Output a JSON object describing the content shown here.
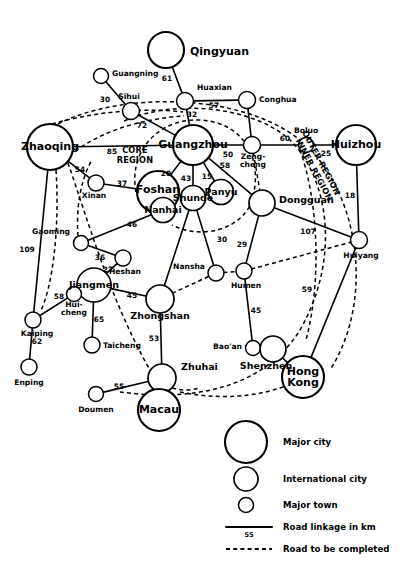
{
  "figure": {
    "type": "network-map",
    "width": 405,
    "height": 577,
    "background": "#ffffff",
    "stroke_color": "#000000"
  },
  "region_labels": [
    {
      "id": "core-region",
      "text_line1": "CORE",
      "text_line2": "REGION",
      "x": 135,
      "y": 150,
      "rotation": 0
    },
    {
      "id": "outer-region",
      "text": "OUTER REGION",
      "x": 321,
      "y": 163,
      "rotation": 62
    },
    {
      "id": "inner-region",
      "text": "INNER REGION",
      "x": 314,
      "y": 170,
      "rotation": 62
    }
  ],
  "nodes": [
    {
      "id": "qingyuan",
      "label": "Qingyuan",
      "x": 166,
      "y": 50,
      "r": 18,
      "tier": "major",
      "label_dx": 24,
      "label_dy": 2,
      "anchor": "start"
    },
    {
      "id": "guangning",
      "label": "Guangning",
      "x": 101,
      "y": 76,
      "r": 7.5,
      "tier": "town",
      "label_dx": 11,
      "label_dy": -2,
      "anchor": "start"
    },
    {
      "id": "sihui",
      "label": "Sihui",
      "x": 131,
      "y": 111,
      "r": 8.5,
      "tier": "town",
      "label_dx": -2,
      "label_dy": -14,
      "anchor": "middle"
    },
    {
      "id": "huaxian",
      "label": "Huaxian",
      "x": 185,
      "y": 101,
      "r": 8.5,
      "tier": "town",
      "label_dx": 12,
      "label_dy": -13,
      "anchor": "start"
    },
    {
      "id": "conghua",
      "label": "Conghua",
      "x": 247,
      "y": 100,
      "r": 8.5,
      "tier": "town",
      "label_dx": 12,
      "label_dy": 0,
      "anchor": "start"
    },
    {
      "id": "boluo",
      "label": "Boluo",
      "x": 306,
      "y": 145,
      "r": 7.5,
      "tier": "town",
      "label_dx": 0,
      "label_dy": -14,
      "anchor": "middle"
    },
    {
      "id": "huizhou",
      "label": "Huizhou",
      "x": 356,
      "y": 145,
      "r": 20,
      "tier": "major",
      "label_dx": 0,
      "label_dy": 0,
      "anchor": "middle"
    },
    {
      "id": "zhaoqing",
      "label": "Zhaoqing",
      "x": 50,
      "y": 147,
      "r": 23,
      "tier": "major",
      "label_dx": 0,
      "label_dy": 0,
      "anchor": "middle"
    },
    {
      "id": "guangzhou",
      "label": "Guangzhou",
      "x": 193,
      "y": 145,
      "r": 20,
      "tier": "major",
      "label_dx": 0,
      "label_dy": 0,
      "anchor": "middle"
    },
    {
      "id": "zengcheng",
      "label": "Zeng-\ncheng",
      "x": 252,
      "y": 145,
      "r": 8.5,
      "tier": "town",
      "label_dx": 1,
      "label_dy": 16,
      "anchor": "middle"
    },
    {
      "id": "xinan",
      "label": "Xinan",
      "x": 96,
      "y": 183,
      "r": 8,
      "tier": "town",
      "label_dx": -2,
      "label_dy": 13,
      "anchor": "middle"
    },
    {
      "id": "foshan",
      "label": "Foshan",
      "x": 158,
      "y": 192,
      "r": 21,
      "tier": "major",
      "label_dx": 0,
      "label_dy": -2,
      "anchor": "middle"
    },
    {
      "id": "nanhai",
      "label": "Nanhai",
      "x": 163,
      "y": 210,
      "r": 12.5,
      "tier": "intl",
      "label_dx": 0,
      "label_dy": 0,
      "anchor": "middle"
    },
    {
      "id": "shunde",
      "label": "Shunde",
      "x": 193,
      "y": 198,
      "r": 12.5,
      "tier": "intl",
      "label_dx": 0,
      "label_dy": 0,
      "anchor": "middle"
    },
    {
      "id": "panyu",
      "label": "Panyu",
      "x": 221,
      "y": 192,
      "r": 12.5,
      "tier": "intl",
      "label_dx": 0,
      "label_dy": 0,
      "anchor": "middle"
    },
    {
      "id": "dongguan",
      "label": "Dongguan",
      "x": 262,
      "y": 203,
      "r": 13,
      "tier": "intl",
      "label_dx": 17,
      "label_dy": -3,
      "anchor": "start"
    },
    {
      "id": "huiyang",
      "label": "Huiyang",
      "x": 359,
      "y": 240,
      "r": 8.5,
      "tier": "town",
      "label_dx": 2,
      "label_dy": 16,
      "anchor": "middle"
    },
    {
      "id": "gaoming",
      "label": "Gaoming",
      "x": 81,
      "y": 243,
      "r": 7.5,
      "tier": "town",
      "label_dx": -11,
      "label_dy": -11,
      "anchor": "end"
    },
    {
      "id": "heshan",
      "label": "Heshan",
      "x": 123,
      "y": 258,
      "r": 8,
      "tier": "town",
      "label_dx": 2,
      "label_dy": 14,
      "anchor": "middle"
    },
    {
      "id": "nansha",
      "label": "Nansha",
      "x": 216,
      "y": 273,
      "r": 8,
      "tier": "town",
      "label_dx": -11,
      "label_dy": -6,
      "anchor": "end"
    },
    {
      "id": "humen",
      "label": "Humen",
      "x": 244,
      "y": 271,
      "r": 8,
      "tier": "town",
      "label_dx": 2,
      "label_dy": 15,
      "anchor": "middle"
    },
    {
      "id": "jiangmen",
      "label": "Jiangmen",
      "x": 94,
      "y": 285,
      "r": 17,
      "tier": "intl",
      "label_dx": 0,
      "label_dy": 0,
      "anchor": "middle"
    },
    {
      "id": "huicheng",
      "label": "Hui-\ncheng",
      "x": 74,
      "y": 294,
      "r": 7.5,
      "tier": "town",
      "label_dx": 0,
      "label_dy": 15,
      "anchor": "middle"
    },
    {
      "id": "zhongshan",
      "label": "Zhongshan",
      "x": 160,
      "y": 299,
      "r": 14,
      "tier": "intl",
      "label_dx": 0,
      "label_dy": 17,
      "anchor": "middle"
    },
    {
      "id": "kaiping",
      "label": "Kaiping",
      "x": 33,
      "y": 320,
      "r": 8,
      "tier": "town",
      "label_dx": 4,
      "label_dy": 14,
      "anchor": "middle"
    },
    {
      "id": "taicheng",
      "label": "Taicheng",
      "x": 92,
      "y": 345,
      "r": 8,
      "tier": "town",
      "label_dx": 11,
      "label_dy": 1,
      "anchor": "start"
    },
    {
      "id": "baoan",
      "label": "Bao'an",
      "x": 253,
      "y": 348,
      "r": 7.5,
      "tier": "town",
      "label_dx": -11,
      "label_dy": -1,
      "anchor": "end"
    },
    {
      "id": "shenzhen",
      "label": "Shenzhen",
      "x": 273,
      "y": 349,
      "r": 13,
      "tier": "intl",
      "label_dx": -7,
      "label_dy": 17,
      "anchor": "middle"
    },
    {
      "id": "enping",
      "label": "Enping",
      "x": 29,
      "y": 367,
      "r": 8,
      "tier": "town",
      "label_dx": 0,
      "label_dy": 16,
      "anchor": "middle"
    },
    {
      "id": "zhuhai",
      "label": "Zhuhai",
      "x": 162,
      "y": 378,
      "r": 14,
      "tier": "intl",
      "label_dx": 19,
      "label_dy": -11,
      "anchor": "start"
    },
    {
      "id": "hongkong",
      "label": "Hong\nKong",
      "x": 303,
      "y": 377,
      "r": 21,
      "tier": "major",
      "label_dx": 0,
      "label_dy": 0,
      "anchor": "middle"
    },
    {
      "id": "doumen",
      "label": "Doumen",
      "x": 96,
      "y": 394,
      "r": 7.5,
      "tier": "town",
      "label_dx": 0,
      "label_dy": 16,
      "anchor": "middle"
    },
    {
      "id": "macau",
      "label": "Macau",
      "x": 159,
      "y": 410,
      "r": 21,
      "tier": "major",
      "label_dx": 0,
      "label_dy": 0,
      "anchor": "middle"
    }
  ],
  "edges": [
    {
      "from": "qingyuan",
      "to": "huaxian",
      "style": "solid",
      "distance": "61",
      "label_x": 167,
      "label_y": 79
    },
    {
      "from": "guangning",
      "to": "sihui",
      "style": "solid",
      "distance": "30",
      "label_x": 105,
      "label_y": 100
    },
    {
      "from": "huaxian",
      "to": "conghua",
      "style": "solid",
      "distance": "57",
      "label_x": 214,
      "label_y": 106
    },
    {
      "from": "huaxian",
      "to": "guangzhou",
      "style": "solid",
      "distance": "32",
      "label_x": 192,
      "label_y": 115
    },
    {
      "from": "sihui",
      "to": "guangzhou",
      "style": "solid",
      "distance": "72",
      "label_x": 142,
      "label_y": 126
    },
    {
      "from": "conghua",
      "to": "zengcheng",
      "style": "solid",
      "distance": "",
      "label_x": 0,
      "label_y": 0
    },
    {
      "from": "zhaoqing",
      "to": "guangzhou",
      "style": "solid",
      "distance": "85",
      "label_x": 112,
      "label_y": 152
    },
    {
      "from": "guangzhou",
      "to": "zengcheng",
      "style": "solid",
      "distance": "50",
      "label_x": 228,
      "label_y": 155
    },
    {
      "from": "zengcheng",
      "to": "boluo",
      "style": "solid",
      "distance": "60",
      "label_x": 285,
      "label_y": 139
    },
    {
      "from": "boluo",
      "to": "huizhou",
      "style": "solid",
      "distance": "25",
      "label_x": 326,
      "label_y": 154
    },
    {
      "from": "huizhou",
      "to": "huiyang",
      "style": "solid",
      "distance": "18",
      "label_x": 350,
      "label_y": 196
    },
    {
      "from": "zhaoqing",
      "to": "xinan",
      "style": "solid",
      "distance": "54",
      "label_x": 80,
      "label_y": 170
    },
    {
      "from": "xinan",
      "to": "foshan",
      "style": "solid",
      "distance": "37",
      "label_x": 122,
      "label_y": 184
    },
    {
      "from": "guangzhou",
      "to": "foshan",
      "style": "solid",
      "distance": "20",
      "label_x": 166,
      "label_y": 174
    },
    {
      "from": "guangzhou",
      "to": "shunde",
      "style": "solid",
      "distance": "43",
      "label_x": 186,
      "label_y": 179
    },
    {
      "from": "guangzhou",
      "to": "panyu",
      "style": "solid",
      "distance": "15",
      "label_x": 207,
      "label_y": 177
    },
    {
      "from": "guangzhou",
      "to": "dongguan",
      "style": "solid",
      "distance": "58",
      "label_x": 225,
      "label_y": 166
    },
    {
      "from": "foshan",
      "to": "shunde",
      "style": "solid",
      "distance": "",
      "label_x": 0,
      "label_y": 0
    },
    {
      "from": "shunde",
      "to": "panyu",
      "style": "solid",
      "distance": "",
      "label_x": 0,
      "label_y": 0
    },
    {
      "from": "shunde",
      "to": "nansha",
      "style": "solid",
      "distance": "30",
      "label_x": 222,
      "label_y": 240
    },
    {
      "from": "shunde",
      "to": "zhongshan",
      "style": "solid",
      "distance": "",
      "label_x": 0,
      "label_y": 0
    },
    {
      "from": "nanhai",
      "to": "gaoming",
      "style": "solid",
      "distance": "46",
      "label_x": 132,
      "label_y": 225
    },
    {
      "from": "gaoming",
      "to": "heshan",
      "style": "solid",
      "distance": "36",
      "label_x": 100,
      "label_y": 258
    },
    {
      "from": "heshan",
      "to": "jiangmen",
      "style": "solid",
      "distance": "27",
      "label_x": 108,
      "label_y": 270
    },
    {
      "from": "dongguan",
      "to": "humen",
      "style": "solid",
      "distance": "29",
      "label_x": 242,
      "label_y": 245
    },
    {
      "from": "dongguan",
      "to": "huiyang",
      "style": "solid",
      "distance": "107",
      "label_x": 308,
      "label_y": 232
    },
    {
      "from": "jiangmen",
      "to": "zhongshan",
      "style": "solid",
      "distance": "45",
      "label_x": 132,
      "label_y": 296
    },
    {
      "from": "jiangmen",
      "to": "huicheng",
      "style": "solid",
      "distance": "",
      "label_x": 0,
      "label_y": 0
    },
    {
      "from": "huicheng",
      "to": "kaiping",
      "style": "solid",
      "distance": "58",
      "label_x": 59,
      "label_y": 297
    },
    {
      "from": "jiangmen",
      "to": "taicheng",
      "style": "solid",
      "distance": "65",
      "label_x": 99,
      "label_y": 320
    },
    {
      "from": "kaiping",
      "to": "enping",
      "style": "solid",
      "distance": "62",
      "label_x": 37,
      "label_y": 342
    },
    {
      "from": "zhaoqing",
      "to": "kaiping",
      "style": "solid",
      "distance": "109",
      "label_x": 27,
      "label_y": 250
    },
    {
      "from": "zhongshan",
      "to": "zhuhai",
      "style": "solid",
      "distance": "53",
      "label_x": 154,
      "label_y": 339
    },
    {
      "from": "humen",
      "to": "baoan",
      "style": "solid",
      "distance": "45",
      "label_x": 256,
      "label_y": 311
    },
    {
      "from": "baoan",
      "to": "shenzhen",
      "style": "solid",
      "distance": "",
      "label_x": 0,
      "label_y": 0
    },
    {
      "from": "huiyang",
      "to": "hongkong",
      "style": "solid",
      "distance": "59",
      "label_x": 307,
      "label_y": 290
    },
    {
      "from": "shenzhen",
      "to": "hongkong",
      "style": "solid",
      "distance": "",
      "label_x": 0,
      "label_y": 0
    },
    {
      "from": "doumen",
      "to": "zhuhai",
      "style": "solid",
      "distance": "55",
      "label_x": 119,
      "label_y": 387
    },
    {
      "from": "zhuhai",
      "to": "macau",
      "style": "solid",
      "distance": "",
      "label_x": 0,
      "label_y": 0
    },
    {
      "from": "zengcheng",
      "to": "dongguan",
      "style": "dashed",
      "distance": "",
      "label_x": 0,
      "label_y": 0
    },
    {
      "from": "nansha",
      "to": "humen",
      "style": "dashed",
      "distance": "",
      "label_x": 0,
      "label_y": 0
    },
    {
      "from": "zhongshan",
      "to": "nansha",
      "style": "dashed",
      "distance": "",
      "label_x": 0,
      "label_y": 0
    },
    {
      "from": "humen",
      "to": "huiyang",
      "style": "dashed",
      "distance": "",
      "label_x": 0,
      "label_y": 0
    }
  ],
  "dashed_arcs": [
    {
      "id": "arc-core-boundary",
      "d": "M 136 192 C 128 150, 160 118, 200 120 C 244 122, 264 160, 252 200 C 243 230, 200 240, 172 225"
    },
    {
      "id": "arc-inner-region",
      "d": "M 124 121 C 170 100, 250 104, 290 140 C 330 180, 340 260, 300 330 C 260 395, 180 400, 120 392"
    },
    {
      "id": "arc-outer-region",
      "d": "M 58 124 C 120 92, 240 92, 300 140 C 360 190, 375 300, 330 370"
    },
    {
      "id": "arc-sihui-sweep-1",
      "d": "M 52 124 C 100 110, 150 108, 183 112"
    },
    {
      "id": "arc-sihui-sweep-2",
      "d": "M 64 160 C 100 128, 150 118, 184 116"
    },
    {
      "id": "arc-zhaoqing-south",
      "d": "M 56 170 C 60 230, 52 290, 40 312"
    },
    {
      "id": "arc-zhaoqing-dn",
      "d": "M 68 163 C 88 220, 110 300, 150 370 C 165 392, 185 392, 200 388"
    },
    {
      "id": "arc-gaoming-link",
      "d": "M 78 236 C 76 210, 80 180, 92 160"
    },
    {
      "id": "arc-bottom-sweep",
      "d": "M 180 392 C 230 402, 280 396, 320 368"
    },
    {
      "id": "arc-ob-south",
      "d": "M 300 150 C 318 200, 322 280, 306 340"
    }
  ],
  "legend": {
    "items": [
      {
        "id": "legend-major-city",
        "shape": "circle",
        "radius": 21,
        "label": "Major city",
        "cx": 246,
        "cy": 442,
        "label_x": 283,
        "label_y": 442
      },
      {
        "id": "legend-intl-city",
        "shape": "circle",
        "radius": 12,
        "label": "International city",
        "cx": 246,
        "cy": 479,
        "label_x": 283,
        "label_y": 479
      },
      {
        "id": "legend-major-town",
        "shape": "circle",
        "radius": 7.5,
        "label": "Major town",
        "cx": 246,
        "cy": 505,
        "label_x": 283,
        "label_y": 505
      },
      {
        "id": "legend-road-linkage",
        "shape": "solid-line",
        "label": "Road linkage in km",
        "sublabel": "55",
        "x1": 226,
        "x2": 272,
        "cy": 527,
        "label_x": 283,
        "label_y": 527
      },
      {
        "id": "legend-road-planned",
        "shape": "dashed-line",
        "label": "Road to be completed",
        "x1": 226,
        "x2": 272,
        "cy": 549,
        "label_x": 283,
        "label_y": 549
      }
    ]
  }
}
